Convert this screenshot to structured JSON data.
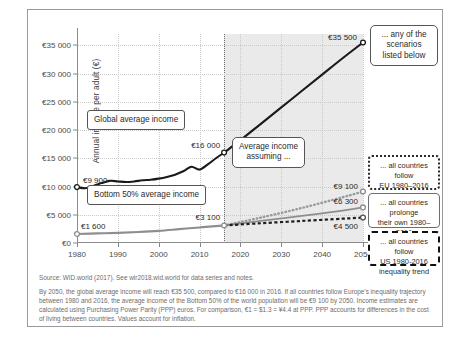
{
  "chart_data": {
    "type": "line",
    "title": "",
    "xlabel": "",
    "ylabel": "Annual income per adult (€)",
    "xlim": [
      1980,
      2050
    ],
    "ylim": [
      0,
      37000
    ],
    "xticks": [
      "1980",
      "1990",
      "2000",
      "2010",
      "2020",
      "2030",
      "2040",
      "2050"
    ],
    "yticks": [
      "€0",
      "€5 000",
      "€10 000",
      "€15 000",
      "€20 000",
      "€25 000",
      "€30 000",
      "€35 000"
    ],
    "grid": true,
    "legend_position": "right",
    "projection_start": 2016,
    "series": [
      {
        "name": "Global average income",
        "style": "solid-black-thick",
        "x": [
          1980,
          1982,
          1984,
          1986,
          1988,
          1990,
          1992,
          1994,
          1996,
          1998,
          2000,
          2002,
          2004,
          2006,
          2008,
          2010,
          2012,
          2014,
          2016
        ],
        "values": [
          9900,
          9700,
          10100,
          10600,
          11000,
          10900,
          10800,
          10900,
          11100,
          11200,
          11400,
          11700,
          12100,
          12700,
          13500,
          13000,
          13900,
          15000,
          16000
        ]
      },
      {
        "name": "Global average income projection",
        "style": "solid-black-thick",
        "x": [
          2016,
          2020,
          2025,
          2030,
          2035,
          2040,
          2045,
          2050
        ],
        "values": [
          16000,
          18200,
          21100,
          24000,
          26900,
          29800,
          32700,
          35500
        ]
      },
      {
        "name": "Bottom 50% average income",
        "style": "solid-gray-thick",
        "x": [
          1980,
          1985,
          1990,
          1995,
          2000,
          2005,
          2010,
          2013,
          2016
        ],
        "values": [
          1600,
          1700,
          1800,
          1950,
          2150,
          2450,
          2750,
          2950,
          3100
        ]
      },
      {
        "name": "Bottom 50% — all countries follow EU 1980-2016 inequality trend",
        "style": "dotted-gray",
        "x": [
          2016,
          2025,
          2035,
          2045,
          2050
        ],
        "values": [
          3100,
          4500,
          6200,
          8100,
          9100
        ]
      },
      {
        "name": "Bottom 50% — all countries prolonge their own 1980-2016 inequality trend",
        "style": "solid-gray",
        "x": [
          2016,
          2025,
          2035,
          2045,
          2050
        ],
        "values": [
          3100,
          3900,
          4800,
          5750,
          6300
        ]
      },
      {
        "name": "Bottom 50% — all countries follow US 1980-2016 inequality trend",
        "style": "dashed-black",
        "x": [
          2016,
          2025,
          2035,
          2045,
          2050
        ],
        "values": [
          3100,
          3500,
          3900,
          4300,
          4500
        ]
      }
    ],
    "annotations": [
      {
        "id": "global-1980",
        "text": "€9 900",
        "x": 1980,
        "y": 9900
      },
      {
        "id": "global-2016",
        "text": "€16 000",
        "x": 2016,
        "y": 16000
      },
      {
        "id": "global-2050",
        "text": "€35 500",
        "x": 2050,
        "y": 35500
      },
      {
        "id": "bottom-1980",
        "text": "€1 600",
        "x": 1980,
        "y": 1600
      },
      {
        "id": "bottom-2016",
        "text": "€3 100",
        "x": 2016,
        "y": 3100
      },
      {
        "id": "eu-2050",
        "text": "€9 100",
        "x": 2050,
        "y": 9100
      },
      {
        "id": "own-2050",
        "text": "€6 300",
        "x": 2050,
        "y": 6300
      },
      {
        "id": "us-2050",
        "text": "€4 500",
        "x": 2050,
        "y": 4500
      }
    ]
  },
  "callouts": {
    "global": "Global average income",
    "bottom50": "Bottom 50%  average income",
    "assuming_line1": "Average income",
    "assuming_line2": "assuming ...",
    "scenarios_line1": "... any of the",
    "scenarios_line2": "scenarios",
    "scenarios_line3": "listed below"
  },
  "scenarios": [
    {
      "id": "eu-trend",
      "line1": "... all countries follow",
      "line2": "EU 1980–2016",
      "line3": "inequality trend",
      "border": "dotted"
    },
    {
      "id": "own-trend",
      "line1": "... all countries prolonge",
      "line2": "their own 1980–2016",
      "line3": "inequality trend",
      "border": "solid"
    },
    {
      "id": "us-trend",
      "line1": "... all countries follow",
      "line2": "US 1980-2016",
      "line3": "inequality trend",
      "border": "dashed"
    }
  ],
  "notes": {
    "source": "Source: WID.world (2017). See wir2018.wid.world for data series and notes.",
    "body": "By 2050, the global average income will reach €35 500, compared to €16 000 in 2016. If all countries follow Europe's inequality trajectory between 1980 and 2016, the average income of the Bottom 50% of the world population will be €9 100 by 2050. Income estimates are calculated using Purchasing Power Parity (PPP) euros. For comparison, €1 = $1.3 = ¥4.4 at PPP. PPP accounts for differences in the cost of living between countries. Values account for inflation."
  },
  "colors": {
    "global_line": "#1a1a1a",
    "bottom_line": "#8e8e8e",
    "shade": "#e6e6e6",
    "frame": "#9a9a9a",
    "grid": "#c9c9c9"
  }
}
